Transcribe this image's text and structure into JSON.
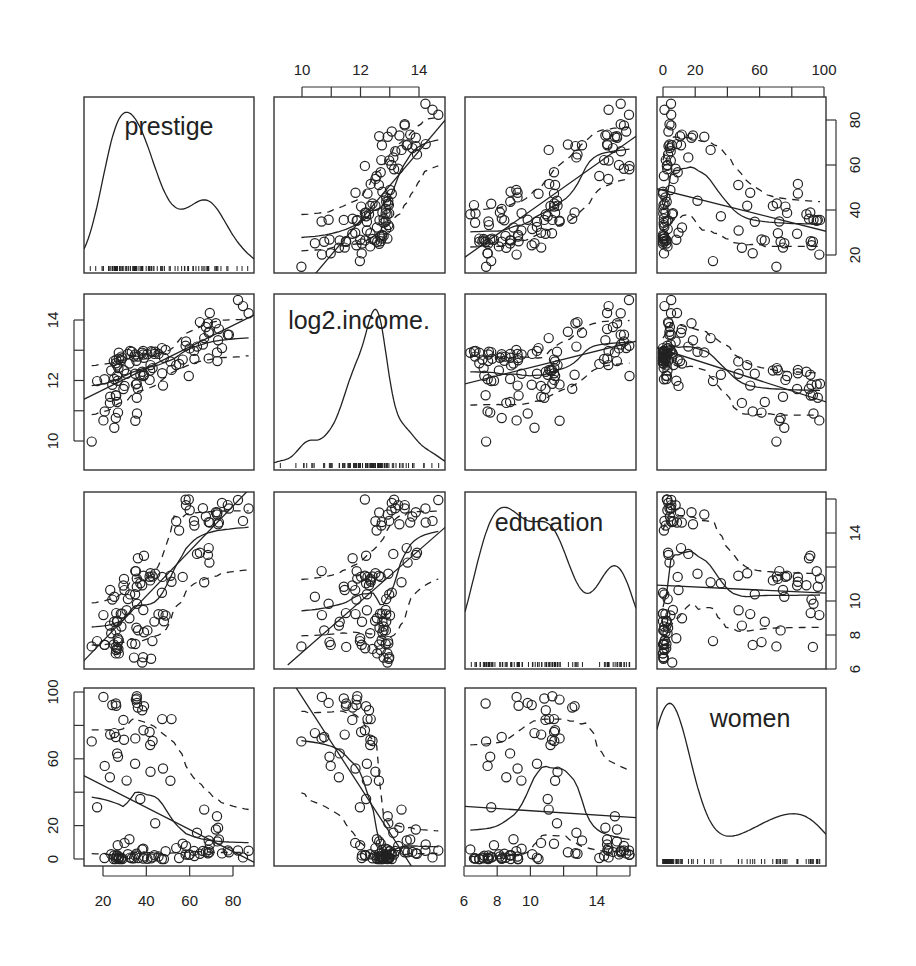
{
  "chart_data": {
    "type": "scatter",
    "subtype": "scatterplot-matrix",
    "title": "",
    "variables": [
      "prestige",
      "log2.income.",
      "education",
      "women"
    ],
    "diagonal": "density with rug",
    "off_diagonal": "scatter with linear fit (solid), loess smooth (solid) and spread lines (dashed)",
    "axes": {
      "prestige": {
        "ticks": [
          20,
          40,
          60,
          80
        ],
        "range": [
          14.8,
          87.2
        ],
        "tick_side": "bottom (col 1) / right (row 1)"
      },
      "log2.income.": {
        "ticks": [
          10,
          12,
          14
        ],
        "minor_ticks": [
          11,
          13
        ],
        "range": [
          9.3,
          14.7
        ],
        "tick_side": "top (col 2) / left (row 2)"
      },
      "education": {
        "ticks": [
          6,
          8,
          10,
          12,
          14,
          16
        ],
        "tick_labels_x": [
          "6",
          "8",
          "10",
          "14"
        ],
        "tick_labels_y": [
          "6",
          "8",
          "10",
          "14"
        ],
        "range": [
          6.38,
          15.97
        ],
        "tick_side": "bottom (col 3) / right (row 3)"
      },
      "women": {
        "ticks": [
          0,
          20,
          40,
          60,
          80,
          100
        ],
        "tick_labels_x": [
          "0",
          "20",
          "60",
          "100"
        ],
        "tick_labels_y": [
          "0",
          "20",
          "60",
          "100"
        ],
        "range": [
          0,
          97.5
        ],
        "tick_side": "top (col 4) / left (row 4)"
      }
    },
    "observations": {
      "prestige": [
        68.8,
        69.1,
        63.4,
        56.8,
        73.5,
        77.6,
        72.6,
        78.1,
        73.1,
        68.8,
        62.0,
        60.0,
        53.8,
        62.2,
        74.9,
        55.1,
        82.3,
        58.1,
        58.3,
        72.8,
        84.6,
        59.6,
        66.1,
        87.2,
        66.7,
        68.4,
        64.7,
        34.9,
        72.1,
        69.3,
        67.5,
        44.1,
        47.3,
        38.7,
        35.6,
        41.8,
        36.1,
        35.2,
        38.9,
        41.5,
        29.7,
        51.6,
        37.2,
        42.9,
        38.1,
        29.4,
        51.1,
        35.7,
        35.6,
        41.9,
        25.2,
        34.8,
        23.3,
        47.7,
        30.9,
        24.3,
        29.9,
        26.5,
        20.2,
        25.9,
        26.1,
        26.9,
        14.8,
        17.3,
        25.9,
        20.8,
        23.2,
        32.2,
        38.9,
        36.2,
        20.7,
        42.8,
        40.5,
        26.5,
        28.2,
        23.8,
        25.0,
        33.3,
        43.7,
        45.6,
        25.1,
        27.3,
        32.5,
        28.9,
        31.5,
        38.6,
        48.9,
        47.2,
        35.4,
        28.5,
        34.9,
        27.1,
        25.9,
        38.1,
        26.5,
        34.3,
        38.5,
        26.1,
        42.2,
        27.3,
        48.1,
        26.8
      ],
      "log2.income.": [
        13.58,
        13.61,
        13.12,
        12.69,
        13.7,
        13.51,
        12.93,
        13.51,
        13.33,
        12.73,
        12.98,
        13.06,
        12.51,
        12.71,
        13.07,
        12.55,
        14.66,
        13.15,
        13.29,
        12.64,
        14.46,
        12.15,
        13.19,
        14.22,
        13.4,
        13.89,
        13.93,
        10.67,
        13.89,
        14.23,
        13.77,
        12.95,
        12.24,
        12.15,
        11.89,
        12.33,
        11.73,
        11.87,
        12.19,
        12.02,
        12.34,
        12.35,
        12.19,
        12.41,
        12.29,
        11.72,
        12.63,
        10.91,
        11.43,
        12.51,
        10.44,
        12.22,
        11.46,
        11.83,
        12.22,
        11.86,
        11.82,
        11.29,
        10.68,
        10.76,
        11.5,
        10.94,
        9.98,
        11.98,
        11.51,
        10.98,
        11.26,
        12.56,
        12.75,
        12.79,
        12.04,
        12.94,
        12.87,
        12.5,
        12.67,
        12.33,
        12.64,
        12.95,
        12.88,
        12.88,
        12.05,
        12.72,
        12.98,
        12.74,
        12.88,
        12.86,
        13.01,
        13.07,
        12.65,
        12.79,
        12.86,
        12.41,
        12.57,
        12.92,
        12.16,
        12.79,
        12.98,
        12.69,
        12.97,
        12.92,
        12.75,
        11.99
      ],
      "education": [
        13.11,
        12.26,
        12.77,
        11.42,
        14.62,
        15.64,
        15.09,
        15.44,
        14.52,
        14.64,
        14.71,
        15.34,
        14.69,
        14.44,
        15.77,
        14.15,
        15.94,
        15.96,
        15.63,
        15.21,
        14.71,
        15.97,
        15.46,
        15.44,
        11.1,
        12.71,
        12.84,
        11.76,
        15.22,
        14.62,
        14.97,
        11.6,
        11.42,
        11.49,
        11.32,
        11.21,
        12.52,
        11.75,
        12.66,
        11.43,
        11.3,
        11.13,
        11.04,
        11.44,
        10.93,
        10.91,
        11.49,
        9.84,
        10.84,
        11.63,
        10.25,
        10.4,
        10.65,
        9.23,
        9.46,
        10.08,
        10.64,
        8.78,
        9.17,
        8.27,
        9.29,
        7.58,
        7.33,
        7.64,
        7.3,
        7.42,
        8.55,
        8.98,
        8.16,
        8.28,
        7.43,
        7.64,
        8.27,
        8.84,
        9.25,
        8.1,
        7.45,
        7.5,
        8.79,
        9.22,
        8.78,
        7.69,
        10.39,
        9.26,
        10.11,
        9.47,
        9.15,
        10.49,
        8.43,
        8.5,
        7.47,
        7.18,
        6.92,
        6.38,
        7.22,
        6.67,
        6.69,
        7.11,
        6.6,
        6.92,
        8.81,
        7.81
      ],
      "women": [
        11.16,
        4.02,
        15.7,
        9.11,
        11.68,
        5.13,
        25.65,
        4.03,
        18.66,
        5.46,
        4.86,
        2.73,
        6.53,
        1.77,
        3.36,
        0.58,
        5.11,
        2.7,
        7.83,
        10.56,
        0.96,
        2.45,
        4.77,
        4.99,
        29.59,
        3.4,
        3.15,
        72.24,
        17.68,
        8.68,
        4.28,
        21.4,
        83.78,
        77.09,
        97.51,
        68.24,
        90.67,
        95.45,
        91.52,
        76.04,
        71.38,
        83.8,
        35.95,
        70.67,
        89.06,
        83.28,
        46.8,
        93.49,
        96.12,
        52.27,
        75.37,
        57.01,
        74.52,
        54.18,
        46.93,
        92.22,
        9.64,
        63.26,
        97.08,
        73.05,
        91.76,
        61.18,
        70.41,
        31.04,
        93.12,
        55.73,
        49.01,
        11.8,
        1.49,
        0.52,
        0.62,
        1.06,
        0.17,
        2.25,
        0.0,
        2.8,
        0.0,
        0.47,
        2.28,
        1.5,
        2.13,
        1.12,
        0.81,
        0.0,
        2.89,
        6.16,
        4.6,
        0.0,
        3.14,
        0.73,
        2.12,
        0.41,
        0.0,
        5.72,
        1.96,
        0.44,
        0.21,
        0.89,
        0.33,
        0.0,
        0.0,
        8.26
      ]
    }
  },
  "panels": {
    "diag_labels": [
      "prestige",
      "log2.income.",
      "education",
      "women"
    ],
    "top_axis": {
      "col2": [
        "10",
        "12",
        "14"
      ],
      "col4": [
        "0",
        "20",
        "60",
        "100"
      ]
    },
    "bottom_axis": {
      "col1": [
        "20",
        "40",
        "60",
        "80"
      ],
      "col3": [
        "6",
        "8",
        "10",
        "14"
      ]
    },
    "left_axis": {
      "row2": [
        "14",
        "12",
        "10"
      ],
      "row4": [
        "100",
        "60",
        "20",
        "0"
      ]
    },
    "right_axis": {
      "row1": [
        "80",
        "60",
        "40",
        "20"
      ],
      "row3": [
        "14",
        "10",
        "8",
        "6"
      ]
    }
  }
}
